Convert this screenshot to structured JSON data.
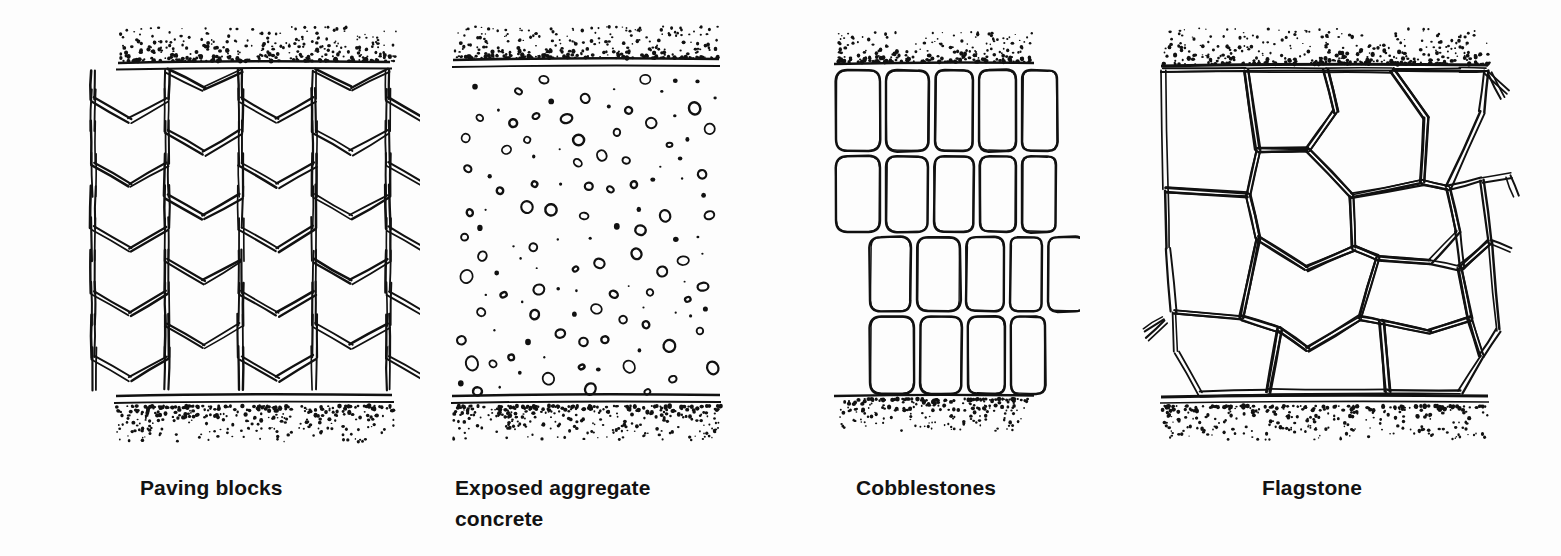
{
  "figure": {
    "kind": "line-drawing-plate",
    "background_color": "#fdfdfd",
    "ink_color": "#111111",
    "panel_count": 4
  },
  "panels": [
    {
      "id": "paving-blocks",
      "caption": "Paving blocks",
      "pattern": "hexagonal interlocking blocks",
      "art_left": 55,
      "art_right": 395,
      "band_top_y": 62,
      "band_bottom_y": 400
    },
    {
      "id": "exposed-aggregate",
      "caption": "Exposed aggregate\nconcrete",
      "pattern": "scattered pebbles and dots",
      "art_left": 455,
      "art_right": 715,
      "band_top_y": 60,
      "band_bottom_y": 400
    },
    {
      "id": "cobblestones",
      "caption": "Cobblestones",
      "pattern": "rows of rounded rectangular setts",
      "art_left": 836,
      "art_right": 1032,
      "band_top_y": 64,
      "band_bottom_y": 398
    },
    {
      "id": "flagstone",
      "caption": "Flagstone",
      "pattern": "irregular polygonal crazy paving",
      "art_left": 1163,
      "art_right": 1486,
      "band_top_y": 66,
      "band_bottom_y": 400
    }
  ],
  "captions": {
    "paving_blocks": "Paving blocks",
    "exposed_aggregate": "Exposed aggregate\nconcrete",
    "cobblestones": "Cobblestones",
    "flagstone": "Flagstone"
  }
}
